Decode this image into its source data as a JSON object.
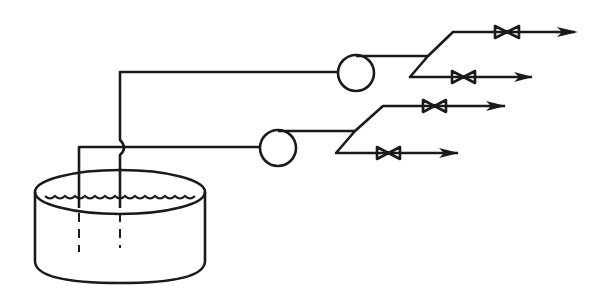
{
  "diagram": {
    "type": "process-flow",
    "components": {
      "tank": {
        "label": "",
        "liquid": true
      },
      "pumps": [
        {
          "id": "pump-1"
        },
        {
          "id": "pump-2"
        }
      ],
      "valves": [
        {
          "id": "valve-1a"
        },
        {
          "id": "valve-1b"
        },
        {
          "id": "valve-2a"
        },
        {
          "id": "valve-2b"
        }
      ],
      "outlets": 4
    },
    "colors": {
      "line": "#1a1a1a",
      "background": "#ffffff"
    }
  }
}
